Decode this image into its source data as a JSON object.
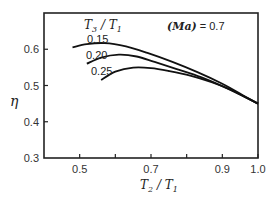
{
  "chart_data": {
    "type": "line",
    "title": "",
    "annotation": "(Ma) = 0.7",
    "xlabel": "T2/T1",
    "ylabel": "η",
    "xlim": [
      0.4,
      1.0
    ],
    "ylim": [
      0.3,
      0.7
    ],
    "xticks": [
      0.5,
      0.6,
      0.7,
      0.8,
      0.9,
      1.0
    ],
    "xtick_labels": [
      "0.5",
      "",
      "0.7",
      "",
      "0.9",
      "1.0"
    ],
    "yticks": [
      0.3,
      0.4,
      0.5,
      0.6
    ],
    "ytick_labels": [
      "0.3",
      "0.4",
      "0.5",
      "0.6"
    ],
    "grid": false,
    "legend_title": "T3/T1",
    "series": [
      {
        "name": "0.15",
        "x": [
          0.48,
          0.52,
          0.57,
          0.63,
          0.69,
          0.76,
          0.83,
          0.9,
          0.96,
          1.0
        ],
        "y": [
          0.605,
          0.614,
          0.617,
          0.608,
          0.59,
          0.565,
          0.537,
          0.505,
          0.472,
          0.45
        ]
      },
      {
        "name": "0.20",
        "x": [
          0.52,
          0.56,
          0.61,
          0.66,
          0.71,
          0.77,
          0.84,
          0.9,
          0.96,
          1.0
        ],
        "y": [
          0.56,
          0.577,
          0.585,
          0.58,
          0.565,
          0.546,
          0.523,
          0.498,
          0.47,
          0.45
        ]
      },
      {
        "name": "0.25",
        "x": [
          0.56,
          0.6,
          0.65,
          0.7,
          0.75,
          0.81,
          0.87,
          0.92,
          0.97,
          1.0
        ],
        "y": [
          0.515,
          0.538,
          0.549,
          0.548,
          0.54,
          0.527,
          0.509,
          0.49,
          0.465,
          0.45
        ]
      }
    ]
  },
  "labels": {
    "legend_title_main": "T",
    "legend_title_sub1": "3",
    "legend_title_slash": " / T",
    "legend_title_sub2": "1",
    "annotation_text": "(Ma)",
    "annotation_value": " = 0.7",
    "xlabel_main": "T",
    "xlabel_sub1": "2",
    "xlabel_slash": " / T",
    "xlabel_sub2": "1",
    "ylabel": "η",
    "series_0": "0.15",
    "series_1": "0.20",
    "series_2": "0.25"
  }
}
